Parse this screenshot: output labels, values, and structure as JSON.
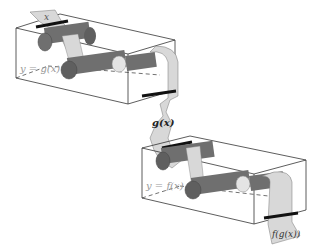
{
  "diagram": {
    "labels": {
      "input": "x",
      "machine1": "y = g(x)",
      "intermediate": "g(x)",
      "machine2": "y = f(x)",
      "output": "f(g(x))"
    },
    "colors": {
      "tape": "#d8d8d8",
      "roller": "#6f6f6f",
      "roller_light": "#e4e4e4",
      "box_line": "#333333",
      "slot": "#111111",
      "machine_label": "#999999"
    }
  }
}
